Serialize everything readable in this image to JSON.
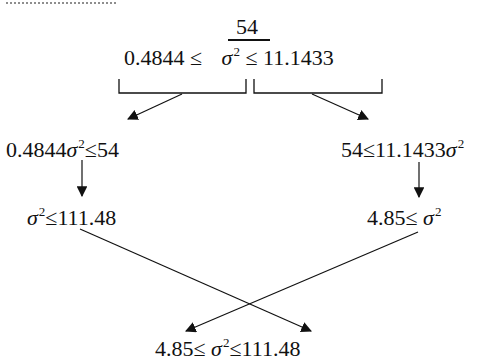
{
  "diagram": {
    "top": {
      "fraction_numerator": "54",
      "left_bound": "0.4844 ≤",
      "sigma": "σ",
      "exponent": "2",
      "right_bound": "≤ 11.1433"
    },
    "left_branch": {
      "step1_prefix": "0.4844",
      "step1_sigma": "σ",
      "step1_exp": "2",
      "step1_suffix": "≤54",
      "step2_sigma": "σ",
      "step2_exp": "2",
      "step2_suffix": "≤111.48"
    },
    "right_branch": {
      "step1_prefix": "54≤11.1433",
      "step1_sigma": "σ",
      "step1_exp": "2",
      "step2_prefix": "4.85≤ ",
      "step2_sigma": "σ",
      "step2_exp": "2"
    },
    "result": {
      "prefix": "4.85≤ ",
      "sigma": "σ",
      "exp": "2",
      "suffix": "≤111.48"
    },
    "colors": {
      "ink": "#111111",
      "background": "#ffffff"
    }
  }
}
